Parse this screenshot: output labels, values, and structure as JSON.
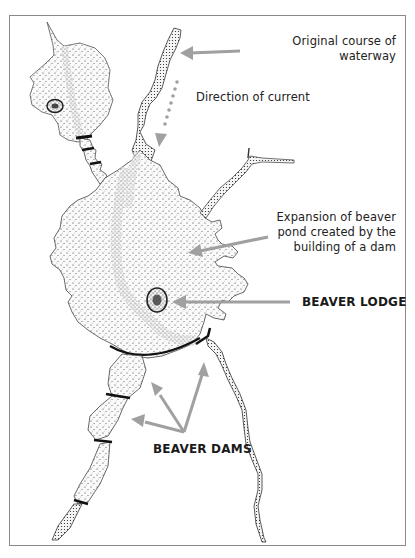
{
  "figure": {
    "colors": {
      "arrow": "#a0a0a0",
      "stipple": "#2a2a2a",
      "dam": "#1a1a1a",
      "frame": "#8a8a8a"
    }
  },
  "labels": {
    "original_course": [
      "Original course of",
      "waterway"
    ],
    "direction": "Direction of current",
    "expansion": [
      "Expansion of beaver",
      "pond created by the",
      "building of a dam"
    ],
    "lodge": "BEAVER LODGE",
    "dams": "BEAVER DAMS"
  }
}
